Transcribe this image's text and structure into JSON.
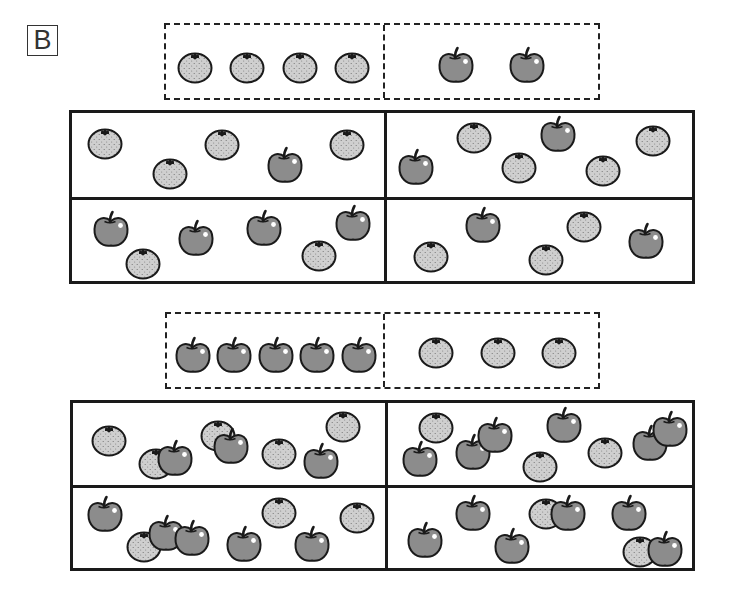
{
  "panel_label": "B",
  "colors": {
    "apple_fill": "#8c8c8c",
    "orange_fill": "#cfcfcf",
    "outline": "#1a1a1a",
    "background": "#ffffff"
  },
  "icons": {
    "apple": "apple-icon",
    "orange": "orange-icon"
  },
  "problems": [
    {
      "id": "top",
      "reference": {
        "left": {
          "fruit": "orange",
          "count": 4
        },
        "right": {
          "fruit": "apple",
          "count": 2
        }
      },
      "panels": [
        {
          "position": "top-left",
          "apples": 1,
          "oranges": 4
        },
        {
          "position": "top-right",
          "apples": 2,
          "oranges": 4
        },
        {
          "position": "bottom-left",
          "apples": 4,
          "oranges": 2
        },
        {
          "position": "bottom-right",
          "apples": 2,
          "oranges": 3
        }
      ]
    },
    {
      "id": "bottom",
      "reference": {
        "left": {
          "fruit": "apple",
          "count": 5
        },
        "right": {
          "fruit": "orange",
          "count": 3
        }
      },
      "panels": [
        {
          "position": "top-left",
          "apples": 3,
          "oranges": 5
        },
        {
          "position": "top-right",
          "apples": 6,
          "oranges": 3
        },
        {
          "position": "bottom-left",
          "apples": 5,
          "oranges": 3
        },
        {
          "position": "bottom-right",
          "apples": 6,
          "oranges": 2
        }
      ]
    }
  ],
  "fruit_positions": [
    [
      "orange",
      178,
      52,
      "ref"
    ],
    [
      "orange",
      230,
      52,
      "ref"
    ],
    [
      "orange",
      283,
      52,
      "ref"
    ],
    [
      "orange",
      335,
      52,
      "ref"
    ],
    [
      "apple",
      438,
      48,
      "ref"
    ],
    [
      "apple",
      509,
      48,
      "ref"
    ],
    [
      "orange",
      88,
      128,
      "p"
    ],
    [
      "orange",
      153,
      158,
      "p"
    ],
    [
      "orange",
      205,
      129,
      "p"
    ],
    [
      "apple",
      267,
      148,
      "p"
    ],
    [
      "orange",
      330,
      129,
      "p"
    ],
    [
      "apple",
      398,
      150,
      "p"
    ],
    [
      "orange",
      457,
      122,
      "p"
    ],
    [
      "apple",
      540,
      117,
      "p"
    ],
    [
      "orange",
      502,
      152,
      "p"
    ],
    [
      "orange",
      586,
      155,
      "p"
    ],
    [
      "orange",
      636,
      125,
      "p"
    ],
    [
      "apple",
      93,
      212,
      "p"
    ],
    [
      "orange",
      126,
      248,
      "p"
    ],
    [
      "apple",
      178,
      221,
      "p"
    ],
    [
      "apple",
      246,
      211,
      "p"
    ],
    [
      "orange",
      302,
      240,
      "p"
    ],
    [
      "apple",
      335,
      206,
      "p"
    ],
    [
      "orange",
      414,
      241,
      "p"
    ],
    [
      "apple",
      465,
      208,
      "p"
    ],
    [
      "orange",
      529,
      244,
      "p"
    ],
    [
      "orange",
      567,
      211,
      "p"
    ],
    [
      "apple",
      628,
      224,
      "p"
    ],
    [
      "apple",
      175,
      338,
      "ref"
    ],
    [
      "apple",
      216,
      338,
      "ref"
    ],
    [
      "apple",
      258,
      338,
      "ref"
    ],
    [
      "apple",
      299,
      338,
      "ref"
    ],
    [
      "apple",
      341,
      338,
      "ref"
    ],
    [
      "orange",
      419,
      337,
      "ref"
    ],
    [
      "orange",
      481,
      337,
      "ref"
    ],
    [
      "orange",
      542,
      337,
      "ref"
    ],
    [
      "orange",
      92,
      425,
      "p"
    ],
    [
      "orange",
      139,
      448,
      "p"
    ],
    [
      "apple",
      157,
      441,
      "p"
    ],
    [
      "orange",
      201,
      420,
      "p"
    ],
    [
      "apple",
      213,
      429,
      "p"
    ],
    [
      "orange",
      262,
      438,
      "p"
    ],
    [
      "apple",
      303,
      444,
      "p"
    ],
    [
      "orange",
      326,
      411,
      "p"
    ],
    [
      "orange",
      419,
      412,
      "p"
    ],
    [
      "apple",
      402,
      442,
      "p"
    ],
    [
      "apple",
      455,
      435,
      "p"
    ],
    [
      "apple",
      477,
      418,
      "p"
    ],
    [
      "orange",
      523,
      451,
      "p"
    ],
    [
      "apple",
      546,
      408,
      "p"
    ],
    [
      "orange",
      588,
      437,
      "p"
    ],
    [
      "apple",
      632,
      426,
      "p"
    ],
    [
      "apple",
      652,
      412,
      "p"
    ],
    [
      "apple",
      87,
      497,
      "p"
    ],
    [
      "orange",
      127,
      531,
      "p"
    ],
    [
      "apple",
      148,
      516,
      "p"
    ],
    [
      "apple",
      174,
      521,
      "p"
    ],
    [
      "apple",
      226,
      527,
      "p"
    ],
    [
      "orange",
      262,
      497,
      "p"
    ],
    [
      "apple",
      294,
      527,
      "p"
    ],
    [
      "orange",
      340,
      502,
      "p"
    ],
    [
      "apple",
      407,
      523,
      "p"
    ],
    [
      "apple",
      455,
      496,
      "p"
    ],
    [
      "apple",
      494,
      529,
      "p"
    ],
    [
      "orange",
      529,
      498,
      "p"
    ],
    [
      "apple",
      550,
      496,
      "p"
    ],
    [
      "apple",
      611,
      496,
      "p"
    ],
    [
      "orange",
      623,
      536,
      "p"
    ],
    [
      "apple",
      647,
      532,
      "p"
    ]
  ]
}
